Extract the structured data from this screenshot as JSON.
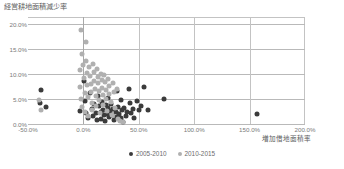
{
  "chart_data": {
    "type": "scatter",
    "title": "経営耕地面積減少率",
    "xlabel": "増加借地面積率",
    "ylabel": "",
    "xlim": [
      -50,
      200
    ],
    "ylim": [
      0,
      21.5
    ],
    "xticks": [
      -50,
      0,
      50,
      100,
      150,
      200
    ],
    "yticks": [
      0,
      5,
      10,
      15,
      20
    ],
    "xtick_labels": [
      "-50.0%",
      "0.0%",
      "50.0%",
      "100.0%",
      "150.0%",
      "200.0%"
    ],
    "ytick_labels": [
      "0.0%",
      "5.0%",
      "10.0%",
      "15.0%",
      "20.0%"
    ],
    "grid": true,
    "legend_position": "bottom",
    "colors": {
      "series_1": "#3b3b3b",
      "series_2": "#b0b0b0",
      "gridline": "#b9b9b9",
      "text": "#6b6b6b"
    },
    "series": [
      {
        "name": "2005-2010",
        "color": "#3b3b3b",
        "points": [
          [
            -38.5,
            6.8
          ],
          [
            -39.0,
            4.2
          ],
          [
            -34.0,
            3.4
          ],
          [
            -3.0,
            2.6
          ],
          [
            0.5,
            8.6
          ],
          [
            1.5,
            4.6
          ],
          [
            2.0,
            2.3
          ],
          [
            4.0,
            1.2
          ],
          [
            6.0,
            6.2
          ],
          [
            7.5,
            3.1
          ],
          [
            8.5,
            1.6
          ],
          [
            10.0,
            4.0
          ],
          [
            11.0,
            2.2
          ],
          [
            12.0,
            0.9
          ],
          [
            13.5,
            5.6
          ],
          [
            14.5,
            3.6
          ],
          [
            15.5,
            2.4
          ],
          [
            16.0,
            1.1
          ],
          [
            17.0,
            4.4
          ],
          [
            18.0,
            2.9
          ],
          [
            18.5,
            1.8
          ],
          [
            19.5,
            0.6
          ],
          [
            20.5,
            3.8
          ],
          [
            21.0,
            2.1
          ],
          [
            22.0,
            5.2
          ],
          [
            22.5,
            3.2
          ],
          [
            23.5,
            1.4
          ],
          [
            24.0,
            2.6
          ],
          [
            25.0,
            4.1
          ],
          [
            26.0,
            1.9
          ],
          [
            27.0,
            3.0
          ],
          [
            28.0,
            0.8
          ],
          [
            29.0,
            2.4
          ],
          [
            30.0,
            6.6
          ],
          [
            30.5,
            1.5
          ],
          [
            31.5,
            3.5
          ],
          [
            32.5,
            2.0
          ],
          [
            33.5,
            4.8
          ],
          [
            34.0,
            1.2
          ],
          [
            35.0,
            2.8
          ],
          [
            36.0,
            0.5
          ],
          [
            37.0,
            3.3
          ],
          [
            38.0,
            1.7
          ],
          [
            39.5,
            2.5
          ],
          [
            41.0,
            7.0
          ],
          [
            42.0,
            4.3
          ],
          [
            43.0,
            2.2
          ],
          [
            44.5,
            3.1
          ],
          [
            46.0,
            1.3
          ],
          [
            48.0,
            4.6
          ],
          [
            50.0,
            2.8
          ],
          [
            52.0,
            3.6
          ],
          [
            55.0,
            7.4
          ],
          [
            58.0,
            2.9
          ],
          [
            73.0,
            5.0
          ],
          [
            157.0,
            2.1
          ]
        ]
      },
      {
        "name": "2010-2015",
        "color": "#b0b0b0",
        "points": [
          [
            -2.0,
            18.9
          ],
          [
            2.5,
            16.4
          ],
          [
            -1.5,
            14.1
          ],
          [
            -40.0,
            4.8
          ],
          [
            -38.0,
            2.9
          ],
          [
            -3.5,
            10.8
          ],
          [
            -3.0,
            7.4
          ],
          [
            -2.5,
            5.1
          ],
          [
            -1.0,
            3.4
          ],
          [
            0.0,
            11.8
          ],
          [
            0.5,
            9.2
          ],
          [
            1.0,
            6.2
          ],
          [
            1.5,
            2.4
          ],
          [
            2.0,
            12.6
          ],
          [
            3.0,
            10.2
          ],
          [
            3.5,
            7.8
          ],
          [
            4.0,
            5.4
          ],
          [
            4.5,
            1.6
          ],
          [
            5.5,
            11.4
          ],
          [
            6.0,
            9.6
          ],
          [
            6.5,
            8.0
          ],
          [
            7.0,
            6.4
          ],
          [
            7.5,
            4.2
          ],
          [
            8.0,
            2.8
          ],
          [
            9.0,
            12.1
          ],
          [
            9.5,
            10.5
          ],
          [
            10.0,
            8.6
          ],
          [
            10.5,
            7.0
          ],
          [
            11.0,
            5.6
          ],
          [
            11.5,
            3.6
          ],
          [
            12.5,
            11.0
          ],
          [
            13.0,
            9.4
          ],
          [
            13.5,
            8.2
          ],
          [
            14.0,
            6.6
          ],
          [
            14.5,
            4.8
          ],
          [
            15.0,
            2.2
          ],
          [
            16.0,
            10.0
          ],
          [
            16.5,
            8.8
          ],
          [
            17.0,
            7.2
          ],
          [
            17.5,
            5.8
          ],
          [
            18.0,
            3.8
          ],
          [
            19.0,
            9.8
          ],
          [
            19.5,
            8.4
          ],
          [
            20.0,
            6.8
          ],
          [
            20.5,
            5.0
          ],
          [
            21.0,
            2.6
          ],
          [
            22.0,
            9.0
          ],
          [
            23.0,
            7.6
          ],
          [
            23.5,
            6.0
          ],
          [
            24.5,
            4.4
          ],
          [
            25.5,
            1.8
          ],
          [
            26.5,
            8.2
          ],
          [
            27.5,
            6.4
          ],
          [
            28.5,
            3.2
          ],
          [
            30.0,
            7.0
          ],
          [
            31.0,
            1.1
          ],
          [
            33.0,
            0.6
          ],
          [
            36.0,
            0.4
          ]
        ]
      }
    ]
  }
}
